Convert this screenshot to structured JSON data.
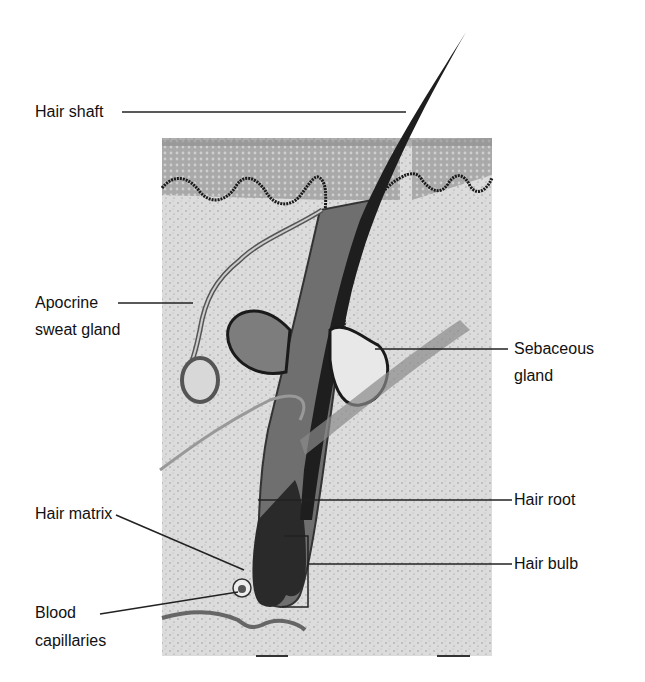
{
  "diagram": {
    "labels": {
      "hair_shaft": "Hair shaft",
      "apocrine_line1": "Apocrine",
      "apocrine_line2": "sweat gland",
      "sebaceous_line1": "Sebaceous",
      "sebaceous_line2": "gland",
      "hair_root": "Hair root",
      "hair_matrix": "Hair matrix",
      "hair_bulb": "Hair bulb",
      "blood_line1": "Blood",
      "blood_line2": "capillaries"
    },
    "colors": {
      "background": "#ffffff",
      "dermis": "#d9d9d9",
      "epidermis": "#a8a8a8",
      "outline": "#1a1a1a",
      "hair": "#2b2b2b",
      "leader": "#222222"
    }
  }
}
